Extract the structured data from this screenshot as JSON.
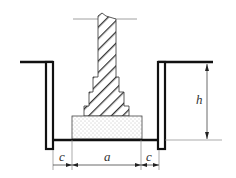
{
  "diagram": {
    "labels": {
      "depth": "h",
      "width": "a",
      "clearance_left": "c",
      "clearance_right": "c"
    },
    "colors": {
      "line": "#111111",
      "hatch": "#333333",
      "sand_dot": "#777777",
      "background": "#ffffff"
    },
    "parts": {
      "column": "hatched stepped foundation column",
      "cushion": "dotted sand cushion",
      "walls": "shoring walls of pit"
    }
  }
}
